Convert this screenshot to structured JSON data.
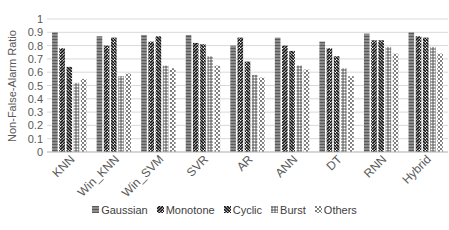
{
  "chart_data": {
    "type": "bar",
    "title": "",
    "xlabel": "",
    "ylabel": "Non-False-Alarm Ratio",
    "ylim": [
      0,
      1
    ],
    "yticks": [
      "0",
      "0.1",
      "0.2",
      "0.3",
      "0.4",
      "0.5",
      "0.6",
      "0.7",
      "0.8",
      "0.9",
      "1"
    ],
    "grid": true,
    "legend_position": "bottom",
    "categories": [
      "KNN",
      "Win_KNN",
      "Win_SVM",
      "SVR",
      "AR",
      "ANN",
      "DT",
      "RNN",
      "Hybrid"
    ],
    "series": [
      {
        "name": "Gaussian",
        "pattern": "horizontal-lines",
        "values": [
          0.9,
          0.87,
          0.88,
          0.88,
          0.8,
          0.86,
          0.83,
          0.89,
          0.9
        ]
      },
      {
        "name": "Monotone",
        "pattern": "zigzag-left",
        "values": [
          0.78,
          0.8,
          0.83,
          0.82,
          0.86,
          0.8,
          0.78,
          0.84,
          0.87
        ]
      },
      {
        "name": "Cyclic",
        "pattern": "zigzag-right",
        "values": [
          0.64,
          0.86,
          0.87,
          0.81,
          0.68,
          0.76,
          0.72,
          0.84,
          0.86
        ]
      },
      {
        "name": "Burst",
        "pattern": "grid",
        "values": [
          0.52,
          0.57,
          0.65,
          0.72,
          0.58,
          0.65,
          0.63,
          0.79,
          0.79
        ]
      },
      {
        "name": "Others",
        "pattern": "dots",
        "values": [
          0.55,
          0.59,
          0.63,
          0.65,
          0.56,
          0.62,
          0.57,
          0.74,
          0.74
        ]
      }
    ]
  },
  "legend": [
    {
      "label": "Gaussian"
    },
    {
      "label": "Monotone"
    },
    {
      "label": "Cyclic"
    },
    {
      "label": "Burst"
    },
    {
      "label": "Others"
    }
  ]
}
